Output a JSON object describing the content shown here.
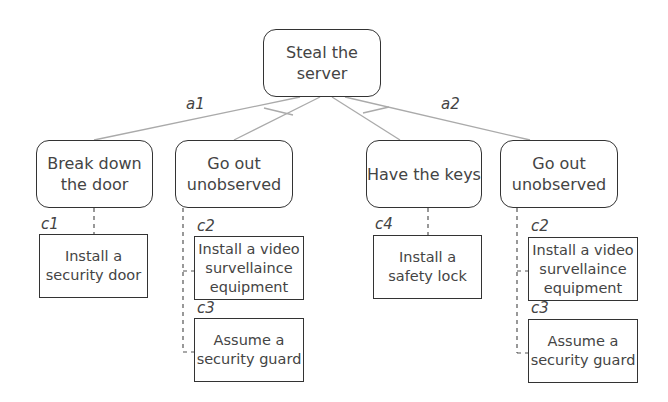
{
  "root": {
    "label": "Steal the\nserver"
  },
  "branches": [
    {
      "label": "a1"
    },
    {
      "label": "a2"
    }
  ],
  "goals": [
    {
      "label": "Break down\nthe door"
    },
    {
      "label": "Go out\nunobserved"
    },
    {
      "label": "Have the keys"
    },
    {
      "label": "Go out\nunobserved"
    }
  ],
  "controls": [
    {
      "id": "c1",
      "label": "Install a\nsecurity door"
    },
    {
      "id": "c2",
      "label": "Install a video\nsurvellaince\nequipment"
    },
    {
      "id": "c3",
      "label": "Assume a\nsecurity guard"
    },
    {
      "id": "c4",
      "label": "Install a\nsafety lock"
    },
    {
      "id": "c2",
      "label": "Install a video\nsurvellaince\nequipment"
    },
    {
      "id": "c3",
      "label": "Assume a\nsecurity guard"
    }
  ],
  "colors": {
    "line": "#aaaaaa",
    "border": "#333333",
    "text": "#444444"
  }
}
